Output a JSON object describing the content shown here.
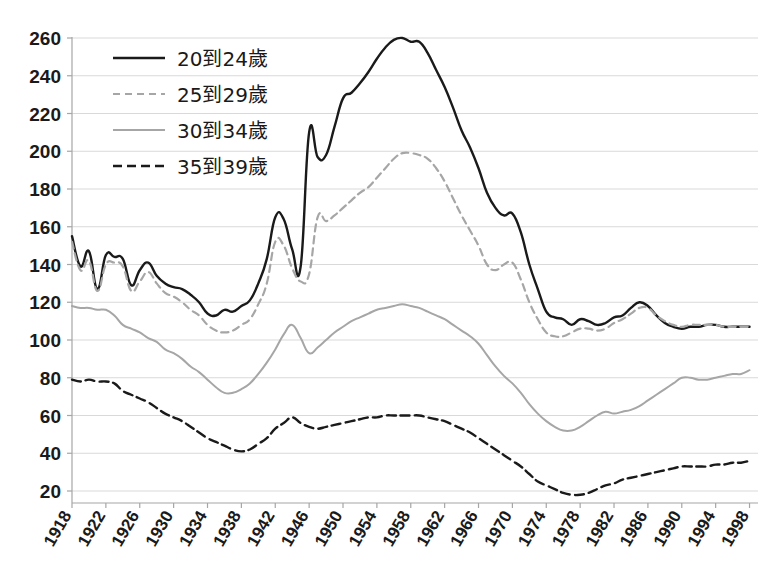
{
  "chart_data": {
    "type": "line",
    "title": "",
    "xlabel": "",
    "ylabel": "",
    "xlim": [
      1918,
      1999
    ],
    "ylim": [
      0,
      270
    ],
    "ytick_start": 20,
    "ytick_end": 260,
    "ytick_step": 20,
    "xtick_start": 1918,
    "xtick_end": 1998,
    "xtick_step": 4,
    "grid": true,
    "legend_position": "top-left",
    "yticks": [
      20,
      40,
      60,
      80,
      100,
      120,
      140,
      160,
      180,
      200,
      220,
      240,
      260
    ],
    "xticks": [
      1918,
      1922,
      1926,
      1930,
      1934,
      1938,
      1942,
      1946,
      1950,
      1954,
      1958,
      1962,
      1966,
      1970,
      1974,
      1978,
      1982,
      1986,
      1990,
      1994,
      1998
    ],
    "x": [
      1918,
      1919,
      1920,
      1921,
      1922,
      1923,
      1924,
      1925,
      1926,
      1927,
      1928,
      1929,
      1930,
      1931,
      1932,
      1933,
      1934,
      1935,
      1936,
      1937,
      1938,
      1939,
      1940,
      1941,
      1942,
      1943,
      1944,
      1945,
      1946,
      1947,
      1948,
      1949,
      1950,
      1951,
      1952,
      1953,
      1954,
      1955,
      1956,
      1957,
      1958,
      1959,
      1960,
      1961,
      1962,
      1963,
      1964,
      1965,
      1966,
      1967,
      1968,
      1969,
      1970,
      1971,
      1972,
      1973,
      1974,
      1975,
      1976,
      1977,
      1978,
      1979,
      1980,
      1981,
      1982,
      1983,
      1984,
      1985,
      1986,
      1987,
      1988,
      1989,
      1990,
      1991,
      1992,
      1993,
      1994,
      1995,
      1996,
      1997,
      1998
    ],
    "series": [
      {
        "name": "20到24歲",
        "style": "solid",
        "color": "#1a1a1a",
        "width": 2.4,
        "values": [
          155,
          139,
          147,
          127,
          145,
          144,
          143,
          129,
          137,
          141,
          134,
          130,
          128,
          127,
          124,
          120,
          114,
          113,
          116,
          115,
          118,
          121,
          130,
          143,
          165,
          164,
          148,
          139,
          210,
          197,
          198,
          213,
          228,
          231,
          236,
          242,
          249,
          255,
          259,
          260,
          258,
          258,
          252,
          243,
          234,
          223,
          211,
          202,
          191,
          178,
          170,
          166,
          167,
          157,
          140,
          127,
          115,
          112,
          111,
          108,
          111,
          110,
          108,
          109,
          112,
          113,
          117,
          120,
          118,
          113,
          109,
          107,
          106,
          107,
          107,
          108,
          108,
          107,
          107,
          107,
          107
        ]
      },
      {
        "name": "25到29歲",
        "style": "dashed",
        "color": "#a6a6a6",
        "width": 2.2,
        "values": [
          152,
          137,
          142,
          126,
          140,
          141,
          139,
          126,
          131,
          136,
          130,
          125,
          123,
          120,
          116,
          113,
          108,
          105,
          104,
          105,
          108,
          111,
          119,
          130,
          152,
          150,
          138,
          131,
          135,
          165,
          163,
          166,
          170,
          174,
          178,
          181,
          186,
          191,
          196,
          199,
          199,
          198,
          196,
          191,
          184,
          175,
          166,
          158,
          150,
          140,
          137,
          140,
          141,
          132,
          120,
          111,
          104,
          102,
          102,
          104,
          106,
          106,
          105,
          106,
          109,
          111,
          114,
          117,
          117,
          113,
          110,
          108,
          107,
          108,
          108,
          108,
          108,
          107,
          107,
          107,
          107
        ]
      },
      {
        "name": "30到34歲",
        "style": "solid",
        "color": "#a6a6a6",
        "width": 2.0,
        "values": [
          118,
          117,
          117,
          116,
          116,
          113,
          108,
          106,
          104,
          101,
          99,
          95,
          93,
          90,
          86,
          83,
          79,
          75,
          72,
          72,
          74,
          77,
          82,
          88,
          95,
          103,
          108,
          101,
          93,
          96,
          100,
          104,
          107,
          110,
          112,
          114,
          116,
          117,
          118,
          119,
          118,
          117,
          115,
          113,
          111,
          108,
          105,
          102,
          98,
          92,
          86,
          81,
          77,
          72,
          66,
          61,
          57,
          54,
          52,
          52,
          54,
          57,
          60,
          62,
          61,
          62,
          63,
          65,
          68,
          71,
          74,
          77,
          80,
          80,
          79,
          79,
          80,
          81,
          82,
          82,
          84
        ]
      },
      {
        "name": "35到39歲",
        "style": "dashed",
        "color": "#1a1a1a",
        "width": 2.4,
        "values": [
          79,
          78,
          79,
          78,
          78,
          77,
          73,
          71,
          69,
          67,
          64,
          61,
          59,
          57,
          54,
          51,
          48,
          46,
          44,
          42,
          41,
          42,
          45,
          48,
          53,
          56,
          59,
          56,
          54,
          53,
          54,
          55,
          56,
          57,
          58,
          59,
          59,
          60,
          60,
          60,
          60,
          60,
          59,
          58,
          57,
          55,
          53,
          51,
          48,
          45,
          42,
          39,
          36,
          33,
          29,
          25,
          23,
          21,
          19,
          18,
          18,
          19,
          21,
          23,
          24,
          26,
          27,
          28,
          29,
          30,
          31,
          32,
          33,
          33,
          33,
          33,
          34,
          34,
          35,
          35,
          36
        ]
      }
    ]
  },
  "legend": {
    "items": [
      {
        "label": "20到24歲"
      },
      {
        "label": "25到29歲"
      },
      {
        "label": "30到34歲"
      },
      {
        "label": "35到39歲"
      }
    ]
  },
  "colors": {
    "dark": "#1a1a1a",
    "gray": "#a6a6a6",
    "grid": "#d9d9d9",
    "background": "#ffffff"
  }
}
